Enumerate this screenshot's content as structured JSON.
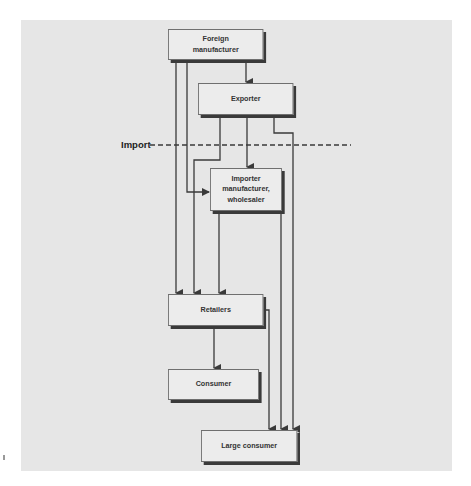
{
  "diagram": {
    "nodes": [
      {
        "id": "foreign_manufacturer",
        "label_lines": [
          "Foreign",
          "manufacturer"
        ]
      },
      {
        "id": "exporter",
        "label_lines": [
          "Exporter"
        ]
      },
      {
        "id": "importer",
        "label_lines": [
          "Importer",
          "manufacturer,",
          "wholesaler"
        ]
      },
      {
        "id": "retailers",
        "label_lines": [
          "Retailers"
        ]
      },
      {
        "id": "consumer",
        "label_lines": [
          "Consumer"
        ]
      },
      {
        "id": "large_consumer",
        "label_lines": [
          "Large consumer"
        ]
      }
    ],
    "edges": [
      {
        "from": "foreign_manufacturer",
        "to": "exporter"
      },
      {
        "from": "foreign_manufacturer",
        "to": "retailers"
      },
      {
        "from": "foreign_manufacturer",
        "to": "importer"
      },
      {
        "from": "exporter",
        "to": "importer"
      },
      {
        "from": "exporter",
        "to": "retailers"
      },
      {
        "from": "exporter",
        "to": "large_consumer"
      },
      {
        "from": "importer",
        "to": "retailers"
      },
      {
        "from": "importer",
        "to": "large_consumer"
      },
      {
        "from": "retailers",
        "to": "consumer"
      },
      {
        "from": "retailers",
        "to": "large_consumer"
      }
    ],
    "boundary": {
      "label": "Import",
      "style": "dashed"
    },
    "colors": {
      "panel": "#e6e6e6",
      "box_fill": "#ececec",
      "line": "#3a3a3a",
      "shadow": "#3a3a3a"
    }
  }
}
